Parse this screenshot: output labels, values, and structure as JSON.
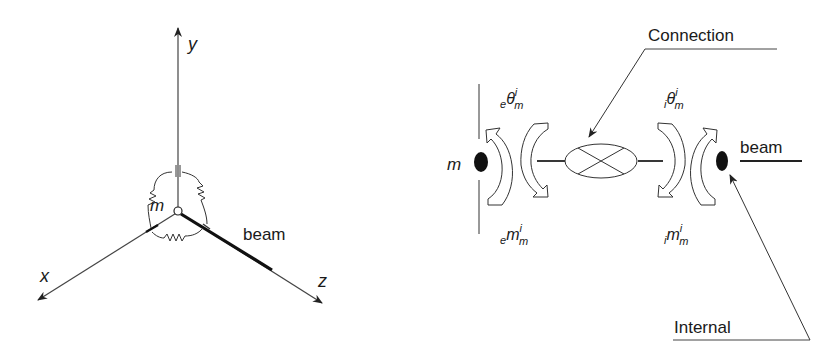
{
  "left_figure": {
    "axes": {
      "y_label": "y",
      "x_label": "x",
      "z_label": "z"
    },
    "node_label": "m",
    "member_label": "beam",
    "components": [
      "rotational-springs",
      "node-circle",
      "beam-member"
    ]
  },
  "right_figure": {
    "node_label": "m",
    "member_label": "beam",
    "connection_label": "Connection",
    "internal_label": "Internal",
    "ext_theta": {
      "pre": "e",
      "sym": "θ",
      "sup": "i",
      "sub": "m"
    },
    "ext_moment": {
      "pre": "e",
      "sym": "m",
      "sup": "i",
      "sub": "m"
    },
    "int_theta": {
      "pre": "i",
      "sym": "θ",
      "sup": "i",
      "sub": "m"
    },
    "int_moment": {
      "pre": "i",
      "sym": "m",
      "sup": "i",
      "sub": "m"
    }
  },
  "colors": {
    "line": "#333333",
    "fill_dark": "#111111",
    "background": "#ffffff"
  }
}
